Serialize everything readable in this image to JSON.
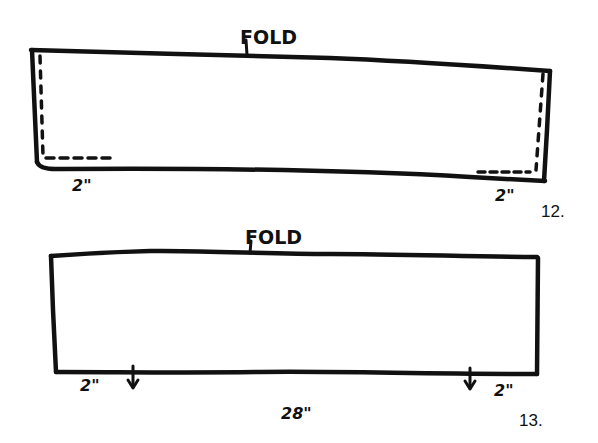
{
  "colors": {
    "ink": "#111111",
    "paper": "#ffffff"
  },
  "figure12": {
    "fold_label": "FOLD",
    "left_dimension": "2\"",
    "right_dimension": "2\"",
    "figure_number": "12."
  },
  "figure13": {
    "fold_label": "FOLD",
    "left_dimension": "2\"",
    "right_dimension": "2\"",
    "width_dimension": "28\"",
    "figure_number": "13."
  }
}
